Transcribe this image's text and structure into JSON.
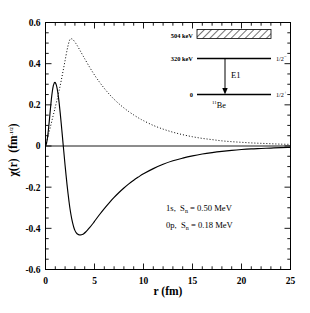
{
  "chart_data": {
    "type": "line",
    "title": "",
    "xlabel": "r  (fm)",
    "ylabel_main": "χ(r)",
    "ylabel_units": "(fm",
    "ylabel_exp": "-1/2",
    "ylabel_close": ")",
    "xlim": [
      0,
      25
    ],
    "ylim": [
      -0.6,
      0.6
    ],
    "xticks": [
      0,
      5,
      10,
      15,
      20,
      25
    ],
    "xticklabels": [
      "0",
      "5",
      "10",
      "15",
      "20",
      "25"
    ],
    "yticks": [
      -0.6,
      -0.4,
      -0.2,
      0,
      0.2,
      0.4,
      0.6
    ],
    "yticklabels": [
      "-0.6",
      "-0.4",
      "-0.2",
      "0",
      "0.2",
      "0.4",
      "0.6"
    ],
    "x_minor_step": 1,
    "y_minor_step": 0.05,
    "grid": false,
    "legend_position": "none",
    "series": [
      {
        "name": "1s",
        "style": "dotted",
        "color": "#000000",
        "points": [
          [
            0.0,
            0.0
          ],
          [
            0.1,
            0.018
          ],
          [
            0.2,
            0.036
          ],
          [
            0.3,
            0.055
          ],
          [
            0.4,
            0.074
          ],
          [
            0.5,
            0.093
          ],
          [
            0.6,
            0.112
          ],
          [
            0.7,
            0.132
          ],
          [
            0.8,
            0.151
          ],
          [
            0.9,
            0.17
          ],
          [
            1.0,
            0.19
          ],
          [
            1.2,
            0.229
          ],
          [
            1.4,
            0.271
          ],
          [
            1.6,
            0.317
          ],
          [
            1.8,
            0.366
          ],
          [
            2.0,
            0.416
          ],
          [
            2.2,
            0.466
          ],
          [
            2.35,
            0.497
          ],
          [
            2.45,
            0.513
          ],
          [
            2.55,
            0.52
          ],
          [
            2.65,
            0.521
          ],
          [
            2.8,
            0.517
          ],
          [
            3.0,
            0.505
          ],
          [
            3.25,
            0.487
          ],
          [
            3.5,
            0.466
          ],
          [
            3.75,
            0.445
          ],
          [
            4.0,
            0.424
          ],
          [
            4.5,
            0.383
          ],
          [
            5.0,
            0.345
          ],
          [
            5.5,
            0.311
          ],
          [
            6.0,
            0.28
          ],
          [
            6.5,
            0.252
          ],
          [
            7.0,
            0.227
          ],
          [
            7.5,
            0.205
          ],
          [
            8.0,
            0.185
          ],
          [
            8.5,
            0.167
          ],
          [
            9.0,
            0.151
          ],
          [
            9.5,
            0.136
          ],
          [
            10.0,
            0.123
          ],
          [
            11.0,
            0.1
          ],
          [
            12.0,
            0.082
          ],
          [
            13.0,
            0.067
          ],
          [
            14.0,
            0.055
          ],
          [
            15.0,
            0.045
          ],
          [
            16.0,
            0.037
          ],
          [
            17.0,
            0.031
          ],
          [
            18.0,
            0.025
          ],
          [
            19.0,
            0.021
          ],
          [
            20.0,
            0.018
          ],
          [
            21.0,
            0.015
          ],
          [
            22.0,
            0.013
          ],
          [
            23.0,
            0.011
          ],
          [
            24.0,
            0.009
          ],
          [
            25.0,
            0.008
          ]
        ]
      },
      {
        "name": "0p",
        "style": "solid",
        "color": "#000000",
        "points": [
          [
            0.0,
            0.0
          ],
          [
            0.1,
            0.012
          ],
          [
            0.2,
            0.04
          ],
          [
            0.3,
            0.08
          ],
          [
            0.4,
            0.128
          ],
          [
            0.5,
            0.179
          ],
          [
            0.6,
            0.227
          ],
          [
            0.7,
            0.266
          ],
          [
            0.8,
            0.293
          ],
          [
            0.9,
            0.307
          ],
          [
            0.95,
            0.309
          ],
          [
            1.0,
            0.308
          ],
          [
            1.1,
            0.297
          ],
          [
            1.2,
            0.276
          ],
          [
            1.3,
            0.245
          ],
          [
            1.4,
            0.206
          ],
          [
            1.5,
            0.161
          ],
          [
            1.6,
            0.112
          ],
          [
            1.7,
            0.06
          ],
          [
            1.8,
            0.008
          ],
          [
            1.85,
            -0.018
          ],
          [
            1.9,
            -0.044
          ],
          [
            2.0,
            -0.095
          ],
          [
            2.1,
            -0.143
          ],
          [
            2.2,
            -0.189
          ],
          [
            2.3,
            -0.231
          ],
          [
            2.4,
            -0.27
          ],
          [
            2.5,
            -0.305
          ],
          [
            2.6,
            -0.334
          ],
          [
            2.7,
            -0.359
          ],
          [
            2.8,
            -0.38
          ],
          [
            2.9,
            -0.397
          ],
          [
            3.0,
            -0.41
          ],
          [
            3.1,
            -0.419
          ],
          [
            3.2,
            -0.425
          ],
          [
            3.3,
            -0.429
          ],
          [
            3.45,
            -0.432
          ],
          [
            3.6,
            -0.432
          ],
          [
            3.75,
            -0.43
          ],
          [
            3.9,
            -0.426
          ],
          [
            4.1,
            -0.418
          ],
          [
            4.3,
            -0.408
          ],
          [
            4.5,
            -0.397
          ],
          [
            4.8,
            -0.379
          ],
          [
            5.0,
            -0.366
          ],
          [
            5.5,
            -0.334
          ],
          [
            6.0,
            -0.304
          ],
          [
            6.5,
            -0.276
          ],
          [
            7.0,
            -0.25
          ],
          [
            7.5,
            -0.226
          ],
          [
            8.0,
            -0.204
          ],
          [
            8.5,
            -0.184
          ],
          [
            9.0,
            -0.166
          ],
          [
            9.5,
            -0.15
          ],
          [
            10.0,
            -0.135
          ],
          [
            11.0,
            -0.11
          ],
          [
            12.0,
            -0.089
          ],
          [
            13.0,
            -0.072
          ],
          [
            14.0,
            -0.059
          ],
          [
            15.0,
            -0.048
          ],
          [
            16.0,
            -0.039
          ],
          [
            17.0,
            -0.032
          ],
          [
            18.0,
            -0.026
          ],
          [
            19.0,
            -0.021
          ],
          [
            20.0,
            -0.017
          ],
          [
            21.0,
            -0.014
          ],
          [
            22.0,
            -0.012
          ],
          [
            23.0,
            -0.01
          ],
          [
            24.0,
            -0.008
          ],
          [
            25.0,
            -0.007
          ]
        ]
      }
    ],
    "annotations": [
      {
        "id": "ann-1s",
        "orbital": "1s,",
        "sym": "S",
        "sub": "n",
        "eq": "= 0.50 MeV"
      },
      {
        "id": "ann-0p",
        "orbital": "0p,",
        "sym": "S",
        "sub": "n",
        "eq": "= 0.18 MeV"
      }
    ]
  },
  "inset": {
    "nucleus_mass": "11",
    "nucleus_symbol": "Be",
    "transition_label": "E1",
    "levels": [
      {
        "id": "level-504",
        "energy_label": "504 keV",
        "spin": "",
        "spin_parity": "",
        "hatched": true
      },
      {
        "id": "level-320",
        "energy_label": "320 keV",
        "spin": "1/2",
        "spin_parity": "−",
        "hatched": false
      },
      {
        "id": "level-0",
        "energy_label": "0",
        "spin": "1/2",
        "spin_parity": "+",
        "hatched": false
      }
    ]
  }
}
